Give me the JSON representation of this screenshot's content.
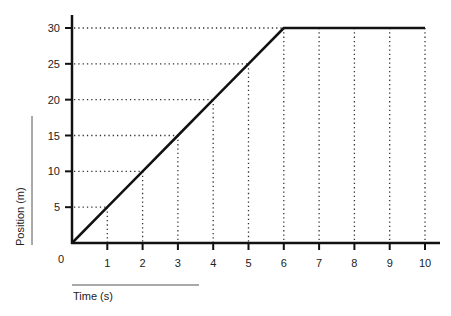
{
  "chart_data": {
    "type": "line",
    "title": "",
    "xlabel": "Time (s)",
    "ylabel": "Position (m)",
    "origin_label": "0",
    "x": [
      0,
      1,
      2,
      3,
      4,
      5,
      6,
      7,
      8,
      9,
      10
    ],
    "series": [
      {
        "name": "Position",
        "values": [
          0,
          5,
          10,
          15,
          20,
          25,
          30,
          30,
          30,
          30,
          30
        ],
        "color": "#111111"
      }
    ],
    "x_ticks": [
      "1",
      "2",
      "3",
      "4",
      "5",
      "6",
      "7",
      "8",
      "9",
      "10"
    ],
    "y_ticks": [
      "5",
      "10",
      "15",
      "20",
      "25",
      "30"
    ],
    "xlim": [
      0,
      10
    ],
    "ylim": [
      0,
      30
    ],
    "grid": "dotted drop-lines from data points to axes",
    "legend": "none"
  }
}
